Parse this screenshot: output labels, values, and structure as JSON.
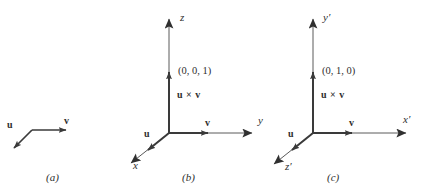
{
  "figure": {
    "stroke_color": "#3a3a3a",
    "text_color": "#2e2e2e",
    "background": "#ffffff",
    "width": 425,
    "height": 192
  },
  "panels": [
    {
      "id": "a",
      "caption": "(a)",
      "vectors": [
        {
          "name": "u",
          "label": "u"
        },
        {
          "name": "v",
          "label": "v"
        }
      ]
    },
    {
      "id": "b",
      "caption": "(b)",
      "axes": [
        {
          "name": "z",
          "label": "z"
        },
        {
          "name": "y",
          "label": "y"
        },
        {
          "name": "x",
          "label": "x"
        }
      ],
      "vectors": [
        {
          "name": "u",
          "label": "u"
        },
        {
          "name": "v",
          "label": "v"
        }
      ],
      "cross_label": "u × v",
      "coordinate": "(0, 0, 1)"
    },
    {
      "id": "c",
      "caption": "(c)",
      "axes": [
        {
          "name": "y-prime",
          "label": "y′"
        },
        {
          "name": "x-prime",
          "label": "x′"
        },
        {
          "name": "z-prime",
          "label": "z′"
        }
      ],
      "vectors": [
        {
          "name": "u",
          "label": "u"
        },
        {
          "name": "v",
          "label": "v"
        }
      ],
      "cross_label": "u × v",
      "coordinate": "(0, 1, 0)"
    }
  ]
}
